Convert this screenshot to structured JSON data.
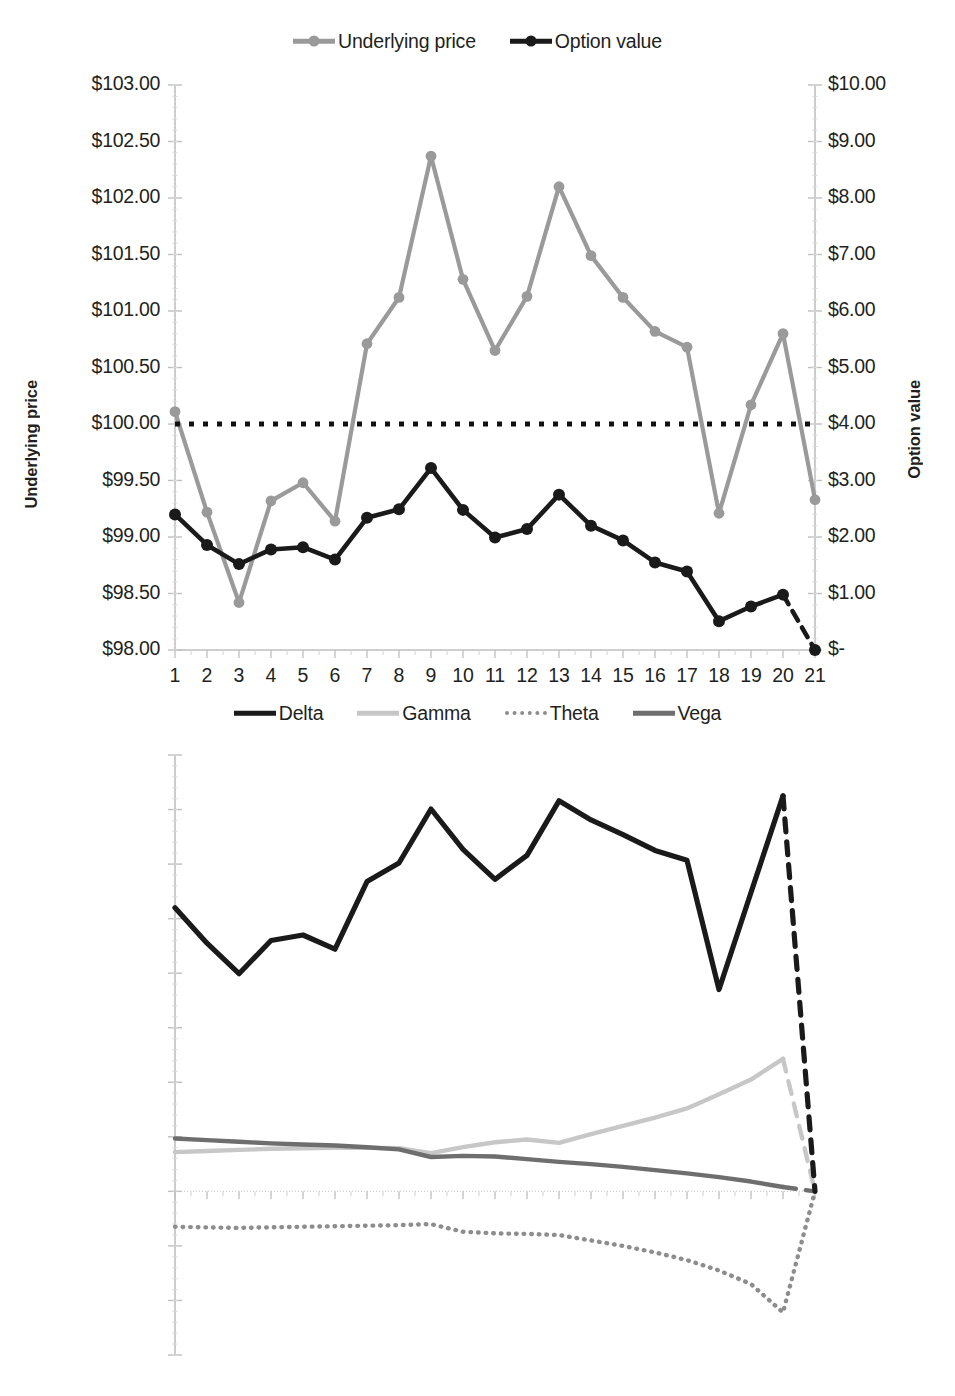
{
  "figure": {
    "panels": [
      "top-option-chart",
      "bottom-greeks-chart"
    ]
  },
  "top_chart": {
    "legend": [
      {
        "label": "Underlying price",
        "color": "#9a9a9a",
        "style": "line-marker"
      },
      {
        "label": "Option value",
        "color": "#1a1a1a",
        "style": "line-marker"
      }
    ],
    "ylabel_left": "Underlying price",
    "ylabel_right": "Option value",
    "yticks_left": [
      "$98.00",
      "$98.50",
      "$99.00",
      "$99.50",
      "$100.00",
      "$100.50",
      "$101.00",
      "$101.50",
      "$102.00",
      "$102.50",
      "$103.00"
    ],
    "yticks_right": [
      "$-",
      "$1.00",
      "$2.00",
      "$3.00",
      "$4.00",
      "$5.00",
      "$6.00",
      "$7.00",
      "$8.00",
      "$9.00",
      "$10.00"
    ],
    "xticks": [
      "1",
      "2",
      "3",
      "4",
      "5",
      "6",
      "7",
      "8",
      "9",
      "10",
      "11",
      "12",
      "13",
      "14",
      "15",
      "16",
      "17",
      "18",
      "19",
      "20",
      "21"
    ]
  },
  "bottom_chart": {
    "legend": [
      {
        "label": "Delta",
        "color": "#1a1a1a",
        "style": "solid"
      },
      {
        "label": "Gamma",
        "color": "#c7c7c7",
        "style": "solid"
      },
      {
        "label": "Theta",
        "color": "#8d8d8d",
        "style": "dotted"
      },
      {
        "label": "Vega",
        "color": "#6e6e6e",
        "style": "solid"
      }
    ],
    "ylabel": "Greek risk measurement",
    "yticks": [
      "-0.30",
      "-0.20",
      "-0.10",
      "0.00",
      "0.10",
      "0.20",
      "0.30",
      "0.40",
      "0.50",
      "0.60",
      "0.70",
      "0.80"
    ],
    "xticks": [
      "1",
      "2",
      "3",
      "4",
      "5",
      "6",
      "7",
      "8",
      "9",
      "10",
      "11",
      "12",
      "13",
      "14",
      "15",
      "16",
      "17",
      "18",
      "19",
      "20",
      "21"
    ]
  },
  "chart_data": [
    {
      "type": "line",
      "id": "top-option-chart",
      "title": "",
      "xlabel": "",
      "ylabel": "Underlying price",
      "ylabel_secondary": "Option value",
      "x": [
        1,
        2,
        3,
        4,
        5,
        6,
        7,
        8,
        9,
        10,
        11,
        12,
        13,
        14,
        15,
        16,
        17,
        18,
        19,
        20,
        21
      ],
      "xlim": [
        1,
        21
      ],
      "ylim": [
        98.0,
        103.0
      ],
      "ylim_secondary": [
        0.0,
        10.0
      ],
      "ytick_step": 0.5,
      "ytick_step_secondary": 1.0,
      "grid": false,
      "legend_position": "top-center",
      "series": [
        {
          "name": "Underlying price",
          "axis": "left",
          "color": "#9a9a9a",
          "markers": true,
          "values": [
            100.11,
            99.22,
            98.42,
            99.32,
            99.48,
            99.14,
            100.71,
            101.12,
            102.37,
            101.28,
            100.65,
            101.13,
            102.1,
            101.49,
            101.12,
            100.82,
            100.68,
            99.21,
            100.17,
            100.8,
            99.33
          ]
        },
        {
          "name": "Option value",
          "axis": "right",
          "color": "#1a1a1a",
          "markers": true,
          "dashed_last_segment": true,
          "values": [
            2.4,
            1.86,
            1.52,
            1.78,
            1.82,
            1.6,
            2.34,
            2.49,
            3.22,
            2.48,
            1.99,
            2.14,
            2.75,
            2.2,
            1.94,
            1.55,
            1.39,
            0.51,
            0.77,
            0.98,
            0.0
          ]
        },
        {
          "name": "Strike reference",
          "axis": "left",
          "color": "#111111",
          "style": "dotted",
          "constant": 100.0
        }
      ]
    },
    {
      "type": "line",
      "id": "bottom-greeks-chart",
      "title": "",
      "xlabel": "",
      "ylabel": "Greek risk measurement",
      "x": [
        1,
        2,
        3,
        4,
        5,
        6,
        7,
        8,
        9,
        10,
        11,
        12,
        13,
        14,
        15,
        16,
        17,
        18,
        19,
        20,
        21
      ],
      "xlim": [
        1,
        21
      ],
      "ylim": [
        -0.3,
        0.8
      ],
      "ytick_step": 0.1,
      "grid": false,
      "legend_position": "top-center",
      "series": [
        {
          "name": "Delta",
          "color": "#1a1a1a",
          "style": "solid",
          "dashed_last_segment": true,
          "values": [
            0.52,
            0.455,
            0.399,
            0.46,
            0.47,
            0.444,
            0.568,
            0.602,
            0.701,
            0.627,
            0.572,
            0.616,
            0.716,
            0.681,
            0.654,
            0.625,
            0.607,
            0.37,
            0.548,
            0.725,
            0.0
          ]
        },
        {
          "name": "Gamma",
          "color": "#c7c7c7",
          "style": "solid",
          "dashed_last_segment": true,
          "values": [
            0.072,
            0.074,
            0.076,
            0.078,
            0.079,
            0.08,
            0.08,
            0.079,
            0.07,
            0.081,
            0.09,
            0.095,
            0.089,
            0.105,
            0.12,
            0.135,
            0.152,
            0.178,
            0.205,
            0.243,
            0.0
          ]
        },
        {
          "name": "Theta",
          "color": "#8d8d8d",
          "style": "dotted",
          "values": [
            -0.065,
            -0.066,
            -0.067,
            -0.066,
            -0.065,
            -0.064,
            -0.063,
            -0.062,
            -0.06,
            -0.074,
            -0.077,
            -0.078,
            -0.08,
            -0.09,
            -0.1,
            -0.112,
            -0.126,
            -0.145,
            -0.17,
            -0.222,
            0.0
          ]
        },
        {
          "name": "Vega",
          "color": "#6e6e6e",
          "style": "solid",
          "dashed_last_segment": true,
          "values": [
            0.097,
            0.094,
            0.091,
            0.088,
            0.086,
            0.084,
            0.081,
            0.077,
            0.063,
            0.065,
            0.064,
            0.059,
            0.054,
            0.05,
            0.045,
            0.039,
            0.033,
            0.026,
            0.018,
            0.008,
            0.0
          ]
        }
      ]
    }
  ]
}
